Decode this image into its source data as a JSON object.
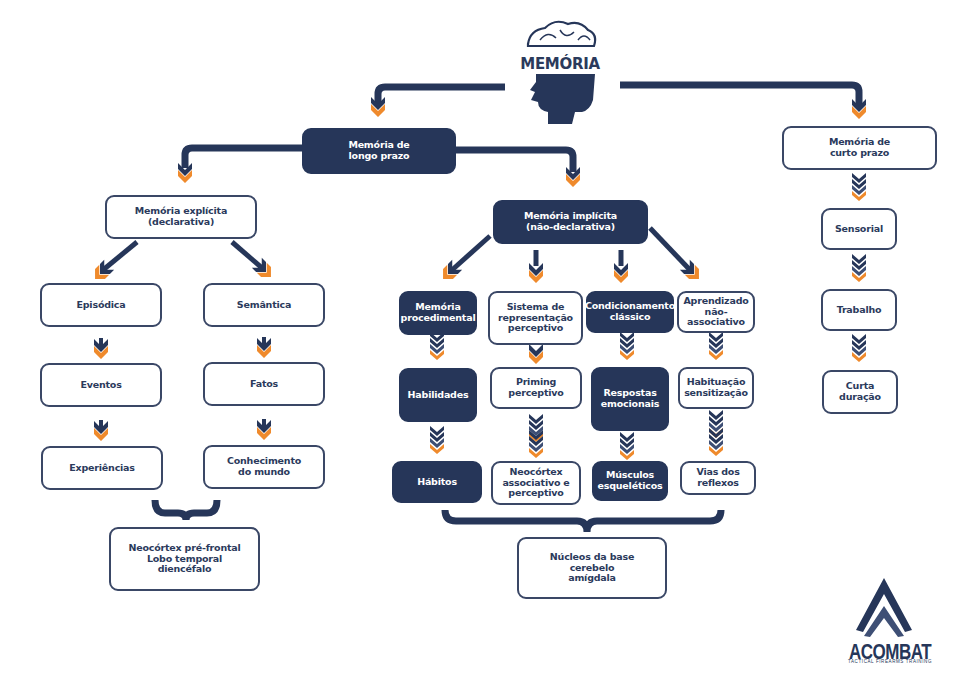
{
  "title": "MEMÓRIA",
  "colors": {
    "navy": "#263659",
    "orange": "#ef8a2c",
    "text": "#2b3a5c",
    "background": "#ffffff"
  },
  "nodes": {
    "longo_prazo": "Memória de\nlongo prazo",
    "curto_prazo": "Memória de\ncurto prazo",
    "explicita": "Memória explícita\n(declarativa)",
    "implicita": "Memória implícita\n(não-declarativa)",
    "episodica": "Episódica",
    "semantica": "Semântica",
    "eventos": "Eventos",
    "fatos": "Fatos",
    "experiencias": "Experiências",
    "conhecimento": "Conhecimento\ndo mundo",
    "explicita_areas": "Neocórtex pré-frontal\nLobo temporal\ndiencéfalo",
    "procedimental": "Memória\nprocedimental",
    "sistema_rep": "Sistema de\nrepresentação\nperceptivo",
    "condicionamento": "Condicionamento\nclássico",
    "aprendizado": "Aprendizado\nnão-associativo",
    "habilidades": "Habilidades",
    "priming": "Priming\nperceptivo",
    "respostas": "Respostas\nemocionais",
    "habituacao": "Habituação\nsensitização",
    "habitos": "Hábitos",
    "neocortex_assoc": "Neocórtex\nassociativo e\nperceptivo",
    "musculos": "Músculos\nesqueléticos",
    "vias": "Vias dos\nreflexos",
    "implicita_areas": "Núcleos da base\ncerebelo\namígdala",
    "sensorial": "Sensorial",
    "trabalho": "Trabalho",
    "curta_duracao": "Curta duração"
  },
  "logo": {
    "name": "ACOMBAT",
    "tagline": "TACTICAL FIREARMS TRAINING"
  },
  "icons": {
    "header": "head-brain-icon",
    "logo": "chevron-a-logo-icon"
  }
}
